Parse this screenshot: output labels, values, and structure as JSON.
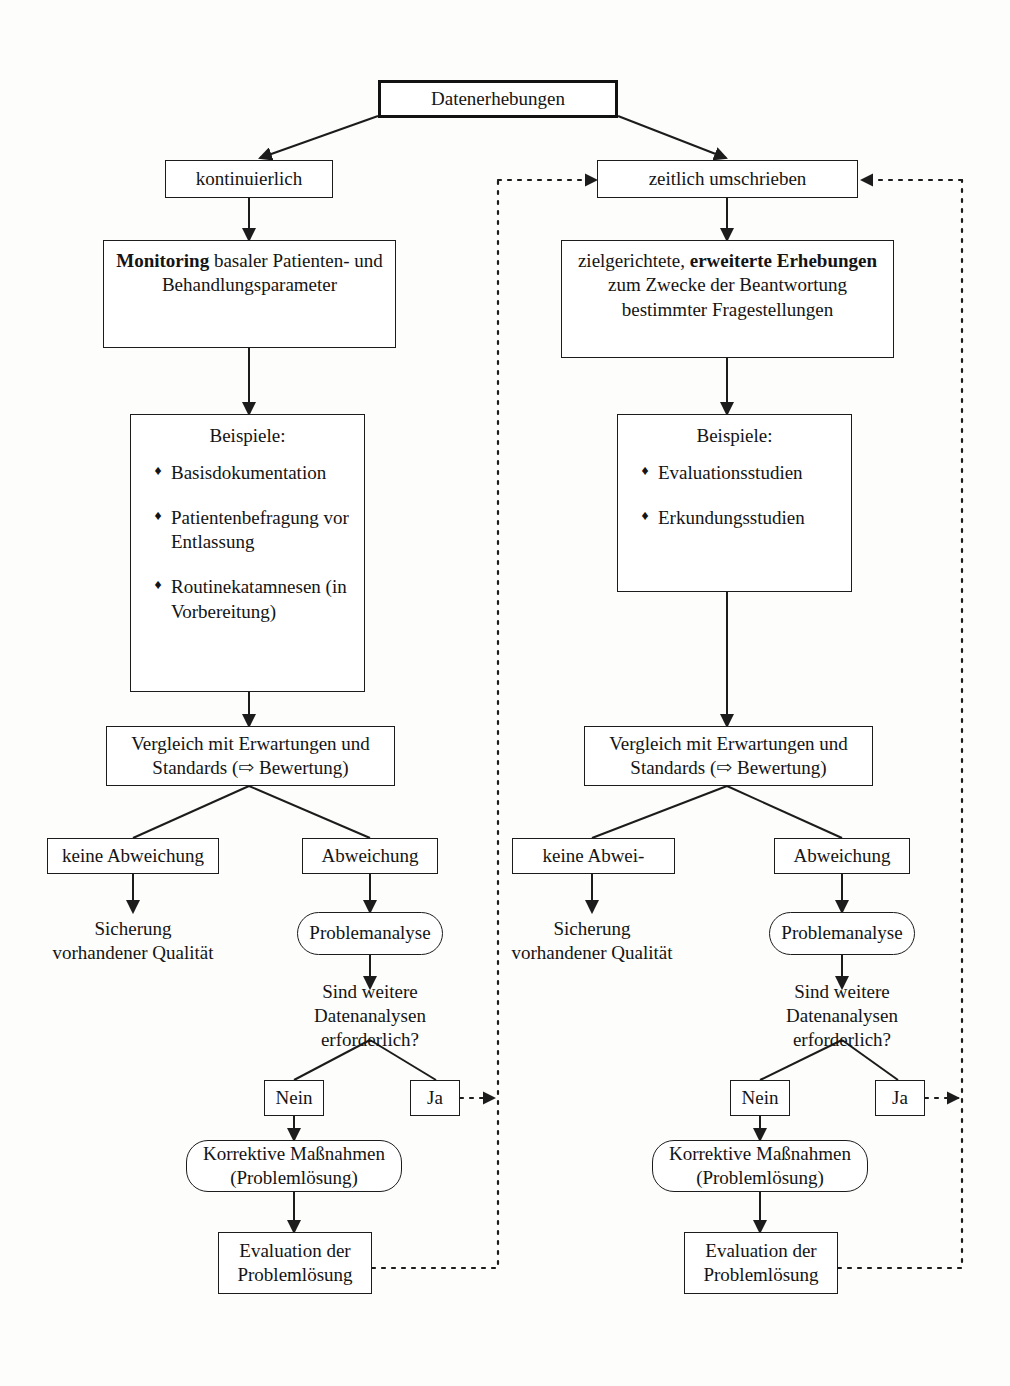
{
  "diagram": {
    "title": "Datenerhebungen",
    "branches": {
      "left_label": "kontinuierlich",
      "right_label": "zeitlich umschrieben"
    },
    "left": {
      "description_prefix": "Monitoring",
      "description_rest": " basaler Patienten- und Behandlungsparameter",
      "examples_title": "Beispiele:",
      "examples": [
        "Basisdokumentation",
        "Patientenbefragung vor Entlassung",
        "Routinekatamnesen (in Vorbereitung)"
      ],
      "compare": "Vergleich mit Erwartungen und Standards (⇨ Bewertung)",
      "no_deviation": "keine Abweichung",
      "deviation": "Abweichung",
      "secure_quality": "Sicherung vorhandener Qualität",
      "problem_analysis": "Problemanalyse",
      "question": "Sind weitere Datenanalysen erforderlich?",
      "answer_no": "Nein",
      "answer_yes": "Ja",
      "corrective": "Korrektive Maßnahmen (Problemlösung)",
      "evaluation": "Evaluation der Problemlösung"
    },
    "right": {
      "description_pre": "zielgerichtete, ",
      "description_bold": "erweiterte Erhebungen",
      "description_post": " zum Zwecke der Beantwortung bestimmter Fragestellungen",
      "examples_title": "Beispiele:",
      "examples": [
        "Evaluationsstudien",
        "Erkundungsstudien"
      ],
      "compare": "Vergleich mit Erwartungen und Standards (⇨ Bewertung)",
      "no_deviation": "keine Abwei-",
      "deviation": "Abweichung",
      "secure_quality": "Sicherung vorhandener Qualität",
      "problem_analysis": "Problemanalyse",
      "question": "Sind weitere Datenanalysen erforderlich?",
      "answer_no": "Nein",
      "answer_yes": "Ja",
      "corrective": "Korrektive Maßnahmen (Problemlösung)",
      "evaluation": "Evaluation der Problemlösung"
    },
    "bullet_glyph": "♦",
    "colors": {
      "line": "#1c1c1c",
      "text": "#141414",
      "background": "#fdfdfb"
    }
  }
}
